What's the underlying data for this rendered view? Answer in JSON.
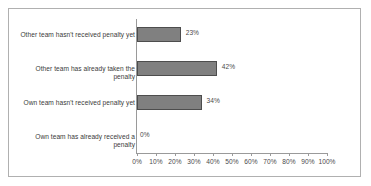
{
  "chart_data": {
    "type": "bar",
    "orientation": "horizontal",
    "title": "",
    "xlabel": "",
    "ylabel": "",
    "categories": [
      "Other team hasn't received penalty yet",
      "Other team has already taken the penalty",
      "Own team hasn't received penalty yet",
      "Own team has already received a penalty"
    ],
    "values": [
      23,
      42,
      34,
      0
    ],
    "data_labels": [
      "23%",
      "42%",
      "34%",
      "0%"
    ],
    "xlim": [
      0,
      100
    ],
    "xticks": [
      0,
      10,
      20,
      30,
      40,
      50,
      60,
      70,
      80,
      90,
      100
    ],
    "xtick_labels": [
      "0%",
      "10%",
      "20%",
      "30%",
      "40%",
      "50%",
      "60%",
      "70%",
      "80%",
      "90%",
      "100%"
    ],
    "grid": false,
    "legend": false,
    "bar_color": "#808080",
    "bar_border_color": "#4d4d4d",
    "axis_color": "#9a9a9a",
    "frame_color": "#b0b0b0",
    "text_color": "#3a3a3a"
  }
}
